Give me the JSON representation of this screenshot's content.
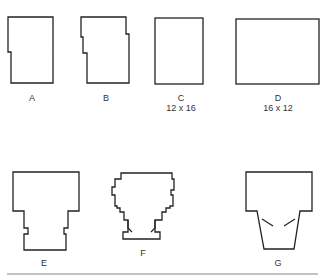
{
  "figure": {
    "shapes": [
      {
        "id": "A",
        "label": "A",
        "dims": ""
      },
      {
        "id": "B",
        "label": "B",
        "dims": ""
      },
      {
        "id": "C",
        "label": "C",
        "dims": "12 x 16"
      },
      {
        "id": "D",
        "label": "D",
        "dims": "16 x 12"
      },
      {
        "id": "E",
        "label": "E",
        "dims": ""
      },
      {
        "id": "F",
        "label": "F",
        "dims": ""
      },
      {
        "id": "G",
        "label": "G",
        "dims": ""
      }
    ],
    "colors": {
      "stroke": "#222222",
      "background": "#ffffff",
      "rule": "#888888"
    }
  }
}
